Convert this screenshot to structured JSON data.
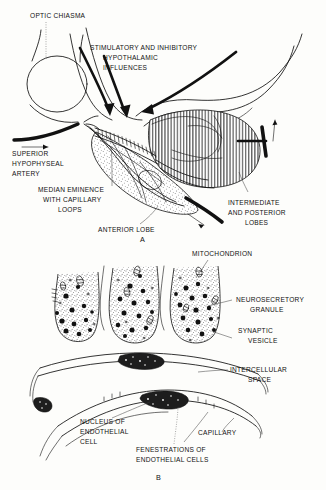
{
  "figure": {
    "background_color": "#fdfdfb",
    "ink_color": "#111111",
    "panels": [
      {
        "id": "A",
        "panel_label": "A",
        "labels": [
          {
            "key": "optic_chiasma",
            "text": "OPTIC CHIASMA"
          },
          {
            "key": "hypothalamic_influences_l1",
            "text": "STIMULATORY AND INHIBITORY"
          },
          {
            "key": "hypothalamic_influences_l2",
            "text": "HYPOTHALAMIC"
          },
          {
            "key": "hypothalamic_influences_l3",
            "text": "INFLUENCES"
          },
          {
            "key": "superior_hypophyseal_artery_l1",
            "text": "SUPERIOR"
          },
          {
            "key": "superior_hypophyseal_artery_l2",
            "text": "HYPOPHYSEAL"
          },
          {
            "key": "superior_hypophyseal_artery_l3",
            "text": "ARTERY"
          },
          {
            "key": "median_eminence_l1",
            "text": "MEDIAN EMINENCE"
          },
          {
            "key": "median_eminence_l2",
            "text": "WITH CAPILLARY"
          },
          {
            "key": "median_eminence_l3",
            "text": "LOOPS"
          },
          {
            "key": "anterior_lobe",
            "text": "ANTERIOR LOBE"
          },
          {
            "key": "intermediate_posterior_l1",
            "text": "INTERMEDIATE"
          },
          {
            "key": "intermediate_posterior_l2",
            "text": "AND POSTERIOR"
          },
          {
            "key": "intermediate_posterior_l3",
            "text": "LOBES"
          }
        ]
      },
      {
        "id": "B",
        "panel_label": "B",
        "labels": [
          {
            "key": "mitochondrion",
            "text": "MITOCHONDRION"
          },
          {
            "key": "neurosecretory_granule_l1",
            "text": "NEUROSECRETORY"
          },
          {
            "key": "neurosecretory_granule_l2",
            "text": "GRANULE"
          },
          {
            "key": "synaptic_vesicle_l1",
            "text": "SYNAPTIC"
          },
          {
            "key": "synaptic_vesicle_l2",
            "text": "VESICLE"
          },
          {
            "key": "intercellular_space_l1",
            "text": "INTERCELLULAR"
          },
          {
            "key": "intercellular_space_l2",
            "text": "SPACE"
          },
          {
            "key": "nucleus_endothelial_l1",
            "text": "NUCLEUS OF"
          },
          {
            "key": "nucleus_endothelial_l2",
            "text": "ENDOTHELIAL"
          },
          {
            "key": "nucleus_endothelial_l3",
            "text": "CELL"
          },
          {
            "key": "capillary",
            "text": "CAPILLARY"
          },
          {
            "key": "fenestrations_l1",
            "text": "FENESTRATIONS OF"
          },
          {
            "key": "fenestrations_l2",
            "text": "ENDOTHELIAL CELLS"
          }
        ]
      }
    ]
  },
  "panelA": {
    "optic_chiasma": "OPTIC CHIASMA",
    "influences_1": "STIMULATORY AND INHIBITORY",
    "influences_2": "HYPOTHALAMIC",
    "influences_3": "INFLUENCES",
    "artery_1": "SUPERIOR",
    "artery_2": "HYPOPHYSEAL",
    "artery_3": "ARTERY",
    "eminence_1": "MEDIAN EMINENCE",
    "eminence_2": "WITH CAPILLARY",
    "eminence_3": "LOOPS",
    "anterior_lobe": "ANTERIOR LOBE",
    "lobes_1": "INTERMEDIATE",
    "lobes_2": "AND POSTERIOR",
    "lobes_3": "LOBES",
    "panel_letter": "A"
  },
  "panelB": {
    "mitochondrion": "MITOCHONDRION",
    "granule_1": "NEUROSECRETORY",
    "granule_2": "GRANULE",
    "vesicle_1": "SYNAPTIC",
    "vesicle_2": "VESICLE",
    "space_1": "INTERCELLULAR",
    "space_2": "SPACE",
    "nucleus_1": "NUCLEUS OF",
    "nucleus_2": "ENDOTHELIAL",
    "nucleus_3": "CELL",
    "capillary": "CAPILLARY",
    "fenestrations_1": "FENESTRATIONS OF",
    "fenestrations_2": "ENDOTHELIAL CELLS",
    "panel_letter": "B"
  }
}
